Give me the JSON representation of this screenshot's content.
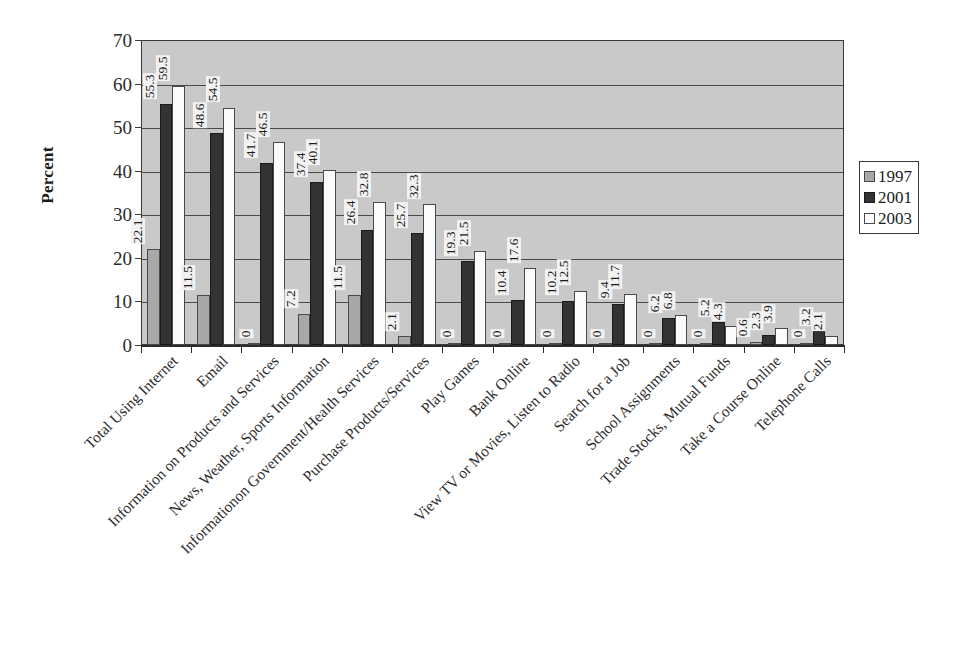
{
  "chart_data": {
    "type": "bar",
    "title": "",
    "xlabel": "",
    "ylabel": "Percent",
    "ylim": [
      0,
      70
    ],
    "yticks": [
      0,
      10,
      20,
      30,
      40,
      50,
      60,
      70
    ],
    "grid": true,
    "legend_position": "right",
    "categories": [
      "Total Using Internet",
      "Email",
      "Information on Products and Services",
      "News, Weather, Sports Information",
      "Informationon Government/Health Services",
      "Purchase Products/Services",
      "Play Games",
      "Bank Online",
      "View TV or Movies, Listen to Radio",
      "Search for a Job",
      "School Assignments",
      "Trade Stocks, Mutual Funds",
      "Take a Course Online",
      "Telephone Calls"
    ],
    "series": [
      {
        "name": "1997",
        "color": "#a8a8a8",
        "values": [
          22.1,
          11.5,
          0,
          7.2,
          11.5,
          2.1,
          0,
          0,
          0,
          0,
          0,
          0,
          0.6,
          0
        ]
      },
      {
        "name": "2001",
        "color": "#333333",
        "values": [
          55.3,
          48.6,
          41.7,
          37.4,
          26.4,
          25.7,
          19.3,
          10.4,
          10.2,
          9.4,
          6.2,
          5.2,
          2.3,
          3.2
        ]
      },
      {
        "name": "2003",
        "color": "#fbfbfb",
        "values": [
          59.5,
          54.5,
          46.5,
          40.1,
          32.8,
          32.3,
          21.5,
          17.6,
          12.5,
          11.7,
          6.8,
          4.3,
          3.9,
          2.1
        ]
      }
    ]
  },
  "legend": {
    "entries": [
      {
        "label": "1997",
        "series": "s1997"
      },
      {
        "label": "2001",
        "series": "s2001"
      },
      {
        "label": "2003",
        "series": "s2003"
      }
    ]
  }
}
